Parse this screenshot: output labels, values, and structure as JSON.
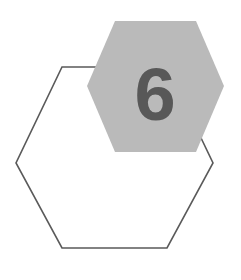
{
  "graphic": {
    "title": "numbered-hexagon-badge",
    "number_label": "6",
    "canvas": {
      "width": 241,
      "height": 280,
      "background": "#ffffff"
    },
    "shapes": {
      "outline_hexagon": {
        "name": "outline-hexagon",
        "style": "stroked",
        "fill": "none",
        "stroke": "#5a5a5a",
        "stroke_width": 1.6,
        "points": "62,67 167,67 213,163 167,248 62,248 16,163"
      },
      "filled_hexagon": {
        "name": "filled-hexagon",
        "style": "filled",
        "fill": "#bababa",
        "stroke": "none",
        "points": "115,21 196,21 224,86 196,152 115,152 87,86"
      }
    },
    "numeral": {
      "text": "6",
      "color": "#585858",
      "x": 155,
      "y": 120,
      "font_size": 74,
      "font_weight": "bold"
    }
  }
}
